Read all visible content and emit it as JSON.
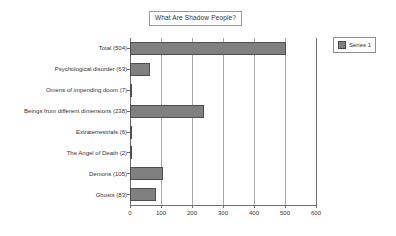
{
  "chart_data": {
    "type": "bar",
    "orientation": "horizontal",
    "title": "What Are Shadow People?",
    "xlabel": "",
    "ylabel": "",
    "xlim": [
      0,
      600
    ],
    "xticks": [
      0,
      100,
      200,
      300,
      400,
      500,
      600
    ],
    "xtick_labels": [
      "0",
      "100",
      "200",
      "300",
      "400",
      "500",
      "600"
    ],
    "grid": true,
    "legend": {
      "position": "top-right",
      "entries": [
        {
          "label": "Series 1",
          "color": "#808080"
        }
      ]
    },
    "categories": [
      "Total (504)",
      "Psychological disorder (63)",
      "Omens of impending doom (7)",
      "Beings from different dimensions (238)",
      "Extraterrestrials (6)",
      "The Angel of Death (2)",
      "Demons (105)",
      "Ghosts (83)"
    ],
    "series": [
      {
        "name": "Series 1",
        "values": [
          504,
          63,
          7,
          238,
          6,
          2,
          105,
          83
        ]
      }
    ]
  },
  "colors": {
    "bar_fill": "#808080",
    "bar_border": "#4f4f4f",
    "axis": "#6e6e6e",
    "grid": "#a8a8a8",
    "background": "#ffffff",
    "text": "#333333"
  }
}
